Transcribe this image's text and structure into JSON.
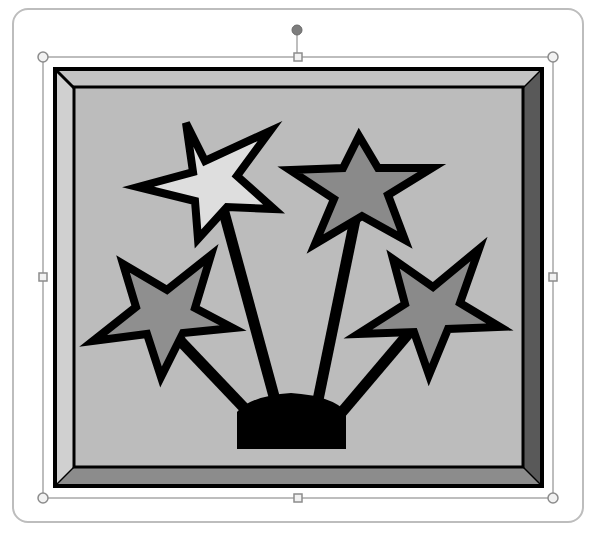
{
  "canvas": {
    "width": 598,
    "height": 539,
    "background": "#ffffff"
  },
  "outer_panel": {
    "border_color": "#bdbdbd",
    "fill": "#ffffff"
  },
  "selection": {
    "line_color": "#a8a8a8",
    "handle_fill": "#f2f2f2",
    "handle_stroke": "#8c8c8c",
    "rotate_handle_fill": "#7d7d7d",
    "corner_handles": [
      "top-left",
      "top-right",
      "bottom-left",
      "bottom-right"
    ],
    "side_handles": [
      "top-middle",
      "left-middle",
      "right-middle",
      "bottom-middle"
    ],
    "rotate_handle": "rotate"
  },
  "clip_art": {
    "description": "Framed picture of four stars on sticks rising from a dome base (fireworks)",
    "frame": {
      "outline_color": "#000000",
      "bevel_top": "#c4c4c4",
      "bevel_left": "#cfcfcf",
      "bevel_right": "#5a5a5a",
      "bevel_bottom": "#8a8a8a",
      "panel_fill": "#bcbcbc"
    },
    "stars": [
      {
        "name": "top-left-star",
        "fill": "#dedede"
      },
      {
        "name": "top-right-star",
        "fill": "#8a8a8a"
      },
      {
        "name": "left-star",
        "fill": "#8f8f8f"
      },
      {
        "name": "right-star",
        "fill": "#8a8a8a"
      }
    ],
    "base_color": "#000000",
    "stick_color": "#000000"
  }
}
